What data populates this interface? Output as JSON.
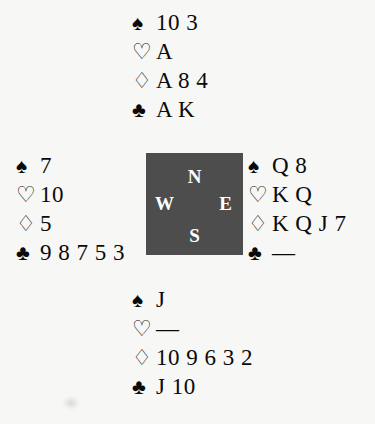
{
  "diagram": {
    "type": "bridge-deal",
    "background_color": "#f7f7f5",
    "suit_symbols": {
      "spades": "♠",
      "hearts": "♡",
      "diamonds": "♢",
      "clubs": "♣"
    },
    "void_marker": "—"
  },
  "compass": {
    "fill_color": "#4d4d4d",
    "text_color": "#fdfdfd",
    "north": "N",
    "west": "W",
    "east": "E",
    "south": "S"
  },
  "hands": {
    "north": {
      "label": "North",
      "spades": "10 3",
      "hearts": "A",
      "diamonds": "A 8 4",
      "clubs": "A K"
    },
    "west": {
      "label": "West",
      "spades": "7",
      "hearts": "10",
      "diamonds": "5",
      "clubs": "9 8 7 5 3"
    },
    "east": {
      "label": "East",
      "spades": "Q 8",
      "hearts": "K Q",
      "diamonds": "K Q J 7",
      "clubs": "—"
    },
    "south": {
      "label": "South",
      "spades": "J",
      "hearts": "—",
      "diamonds": "10 9 6 3 2",
      "clubs": "J 10"
    }
  }
}
